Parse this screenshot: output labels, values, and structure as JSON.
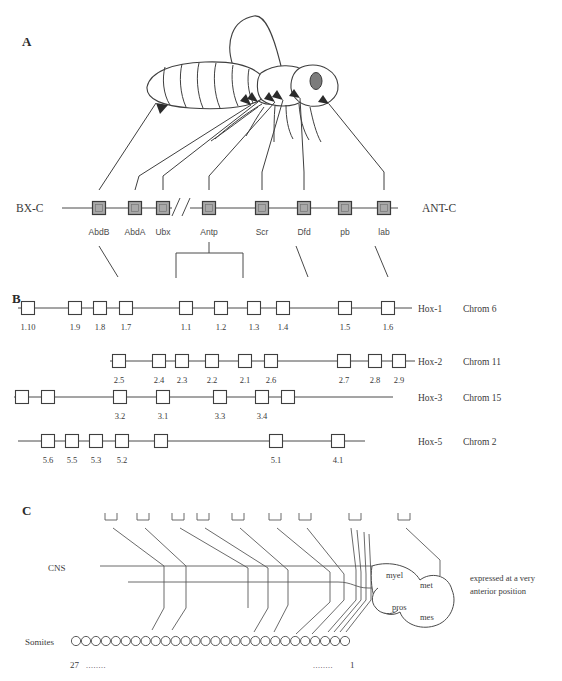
{
  "figure": {
    "panels": [
      {
        "letter": "A"
      },
      {
        "letter": "B"
      },
      {
        "letter": "C"
      }
    ]
  },
  "panel_a": {
    "left_cluster_label": "BX-C",
    "right_cluster_label": "ANT-C",
    "genes": [
      {
        "name": "AbdB",
        "x": 99
      },
      {
        "name": "AbdA",
        "x": 135
      },
      {
        "name": "Ubx",
        "x": 163
      },
      {
        "name": "Antp",
        "x": 209
      },
      {
        "name": "Scr",
        "x": 262
      },
      {
        "name": "Dfd",
        "x": 304
      },
      {
        "name": "pb",
        "x": 345
      },
      {
        "name": "lab",
        "x": 384
      }
    ],
    "line_y": 208,
    "break_symbol": "//"
  },
  "panel_b": {
    "rows": [
      {
        "cluster": "Hox-1",
        "chromosome": "Chrom 6",
        "genes": [
          "1.10",
          "1.9",
          "1.8",
          "1.7",
          "1.1",
          "1.2",
          "1.3",
          "1.4",
          "1.5",
          "1.6"
        ],
        "gene_x": [
          28,
          75,
          100,
          126,
          186,
          221,
          254,
          283,
          345,
          388
        ],
        "line_x1": 18,
        "line_x2": 412,
        "y": 308
      },
      {
        "cluster": "Hox-2",
        "chromosome": "Chrom 11",
        "genes": [
          "2.5",
          "2.4",
          "2.3",
          "2.2",
          "2.1",
          "2.6",
          "2.7",
          "2.8",
          "2.9"
        ],
        "gene_x": [
          119,
          159,
          182,
          212,
          245,
          271,
          344,
          375,
          399
        ],
        "line_x1": 110,
        "line_x2": 415,
        "y": 361
      },
      {
        "cluster": "Hox-3",
        "chromosome": "Chrom 15",
        "genes": [
          "3.2",
          "3.1",
          "3.3",
          "3.4"
        ],
        "gene_x": [
          120,
          163,
          220,
          262
        ],
        "extra_box_x": [
          22,
          48,
          288
        ],
        "line_x1": 14,
        "line_x2": 393,
        "y": 397
      },
      {
        "cluster": "Hox-5",
        "chromosome": "Chrom 2",
        "genes": [
          "5.6",
          "5.5",
          "5.3",
          "5.2",
          "5.1",
          "4.1"
        ],
        "gene_x": [
          48,
          72,
          96,
          122,
          276,
          338
        ],
        "extra_box_x": [
          161
        ],
        "line_x1": 18,
        "line_x2": 365,
        "y": 441
      }
    ]
  },
  "panel_c": {
    "cns_label": "CNS",
    "somites_label": "Somites",
    "somite_count": 28,
    "somite_start_number": "27",
    "somite_end_number": "1",
    "left_dots": "........",
    "right_dots": "........",
    "brain_regions": [
      {
        "label": "myel",
        "x": 386,
        "y": 578
      },
      {
        "label": "met",
        "x": 420,
        "y": 588
      },
      {
        "label": "pros",
        "x": 392,
        "y": 610
      },
      {
        "label": "mes",
        "x": 420,
        "y": 620
      }
    ],
    "annotation_lines": [
      "expressed at a very",
      "anterior position"
    ],
    "bracket_x": [
      111,
      143,
      178,
      203,
      238,
      275,
      305,
      355,
      404
    ],
    "bracket_y": 520
  }
}
